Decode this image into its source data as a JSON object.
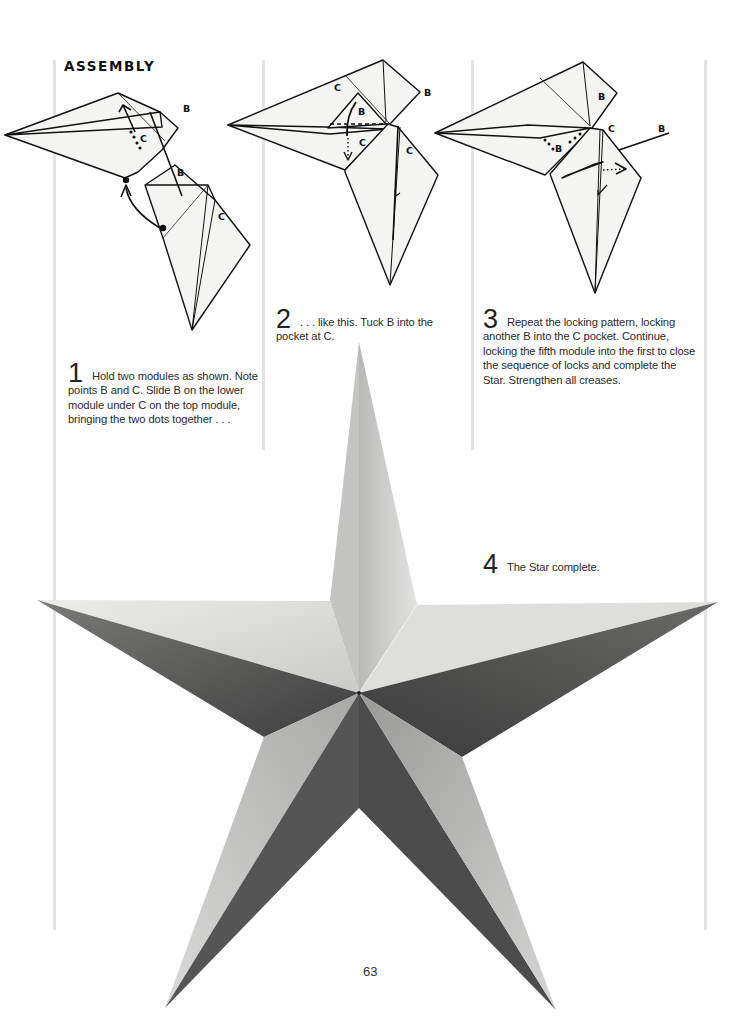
{
  "page": {
    "heading": "ASSEMBLY",
    "page_number": "63"
  },
  "steps": [
    {
      "number": "1",
      "text": "Hold two modules as shown. Note points B and C. Slide B on the lower module under C on the top module, bringing the two dots together . . ."
    },
    {
      "number": "2",
      "text": ". . . like this. Tuck B into the pocket at C."
    },
    {
      "number": "3",
      "text": "Repeat the locking pattern, locking another B into the C pocket. Continue, locking the fifth module into the first to close the sequence of locks and complete the Star. Strengthen all creases."
    },
    {
      "number": "4",
      "text": "The Star complete."
    }
  ],
  "diagram_labels": {
    "step1": [
      "B",
      "C",
      "B",
      "C"
    ],
    "step2": [
      "C",
      "B",
      "B",
      "C",
      "C"
    ],
    "step3": [
      "B",
      "C",
      "B",
      "B"
    ]
  },
  "colors": {
    "paper": "#f4f4f2",
    "line": "#111111",
    "rule": "#e3e3e3",
    "star_light": "#d9d9d7",
    "star_mid": "#a6a6a4",
    "star_dark": "#5a5a5a"
  }
}
